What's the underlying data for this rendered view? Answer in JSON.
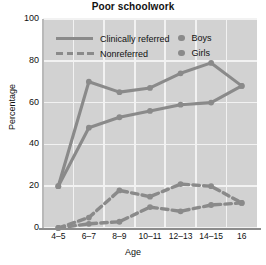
{
  "chart_data": {
    "type": "line",
    "title": "Poor schoolwork",
    "xlabel": "Age",
    "ylabel": "Percentage",
    "categories": [
      "4–5",
      "6–7",
      "8–9",
      "10–11",
      "12–13",
      "14–15",
      "16"
    ],
    "ylim": [
      0,
      100
    ],
    "yticks": [
      0,
      20,
      40,
      60,
      80,
      100
    ],
    "grid": true,
    "legend_position": "inside-top",
    "series": [
      {
        "name": "Clinically referred – Boys",
        "style": "solid",
        "marker": "circle",
        "color": "#8a8a8a",
        "values": [
          20,
          70,
          65,
          67,
          74,
          79,
          68
        ]
      },
      {
        "name": "Clinically referred – Girls",
        "style": "solid",
        "marker": "circle",
        "color": "#8a8a8a",
        "values": [
          20,
          48,
          53,
          56,
          59,
          60,
          68
        ]
      },
      {
        "name": "Nonreferred – Boys",
        "style": "dashed",
        "marker": "circle",
        "color": "#8a8a8a",
        "values": [
          0,
          5,
          18,
          15,
          21,
          20,
          12
        ]
      },
      {
        "name": "Nonreferred – Girls",
        "style": "dashed",
        "marker": "circle",
        "color": "#8a8a8a",
        "values": [
          0,
          2,
          3,
          10,
          8,
          11,
          12
        ]
      }
    ],
    "legend": [
      {
        "label": "Clinically referred",
        "style": "solid"
      },
      {
        "label": "Nonreferred",
        "style": "dashed"
      },
      {
        "label": "Boys",
        "style": "dot"
      },
      {
        "label": "Girls",
        "style": "dot"
      }
    ]
  }
}
